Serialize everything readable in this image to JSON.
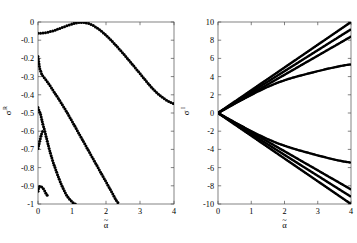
{
  "figure": {
    "background": "#ffffff",
    "line_color": "#000000",
    "panel_count": 2
  },
  "chart_data": [
    {
      "type": "scatter",
      "title": "",
      "subtitle": "",
      "xlabel": "α̃",
      "ylabel": "σ^R",
      "xlabel_base": "α",
      "ylabel_base": "σ",
      "ylabel_sup": "R",
      "xlim": [
        0,
        4
      ],
      "ylim": [
        -1,
        0
      ],
      "xticks": [
        0,
        1,
        2,
        3,
        4
      ],
      "xticklabels": [
        "0",
        "1",
        "2",
        "3",
        "4"
      ],
      "yticks": [
        0,
        -0.1,
        -0.2,
        -0.3,
        -0.4,
        -0.5,
        -0.6,
        -0.7,
        -0.8,
        -0.9,
        -1
      ],
      "yticklabels": [
        "0",
        "-0.1",
        "-0.2",
        "-0.3",
        "-0.4",
        "-0.5",
        "-0.6",
        "-0.7",
        "-0.8",
        "-0.9",
        "-1"
      ],
      "grid": false,
      "legend": null,
      "marker": "dot",
      "marker_size": 1.5,
      "series": [
        {
          "name": "branch-1",
          "comment": "uppermost branch: starts near -0.06, peaks at ~0 near alpha=1.25, decays to -0.45 at alpha=4",
          "x": [
            0.0,
            0.1,
            0.2,
            0.3,
            0.4,
            0.5,
            0.6,
            0.7,
            0.8,
            0.9,
            1.0,
            1.1,
            1.2,
            1.3,
            1.4,
            1.5,
            1.6,
            1.7,
            1.8,
            1.9,
            2.0,
            2.1,
            2.2,
            2.3,
            2.4,
            2.5,
            2.6,
            2.7,
            2.8,
            2.9,
            3.0,
            3.1,
            3.2,
            3.3,
            3.4,
            3.5,
            3.6,
            3.7,
            3.8,
            3.9,
            4.0
          ],
          "y": [
            -0.062,
            -0.061,
            -0.059,
            -0.056,
            -0.051,
            -0.045,
            -0.038,
            -0.031,
            -0.024,
            -0.017,
            -0.011,
            -0.006,
            -0.003,
            -0.002,
            -0.004,
            -0.009,
            -0.017,
            -0.028,
            -0.041,
            -0.056,
            -0.073,
            -0.091,
            -0.11,
            -0.13,
            -0.151,
            -0.172,
            -0.194,
            -0.216,
            -0.238,
            -0.261,
            -0.283,
            -0.306,
            -0.329,
            -0.351,
            -0.372,
            -0.39,
            -0.406,
            -0.42,
            -0.432,
            -0.442,
            -0.45
          ]
        },
        {
          "name": "branch-2",
          "comment": "second branch: from about -0.19 at alpha=0 descending roughly linearly, exits bottom near alpha=2.4",
          "x": [
            0.0,
            0.05,
            0.12,
            0.2,
            0.28,
            0.36,
            0.44,
            0.52,
            0.6,
            0.7,
            0.8,
            0.9,
            1.0,
            1.1,
            1.2,
            1.3,
            1.4,
            1.5,
            1.6,
            1.7,
            1.8,
            1.9,
            2.0,
            2.1,
            2.2,
            2.3,
            2.38
          ],
          "y": [
            -0.19,
            -0.255,
            -0.292,
            -0.31,
            -0.33,
            -0.352,
            -0.375,
            -0.398,
            -0.42,
            -0.45,
            -0.48,
            -0.512,
            -0.545,
            -0.578,
            -0.612,
            -0.645,
            -0.678,
            -0.712,
            -0.745,
            -0.778,
            -0.812,
            -0.845,
            -0.878,
            -0.912,
            -0.945,
            -0.98,
            -1.0
          ]
        },
        {
          "name": "branch-3",
          "comment": "third branch: from about -0.47 at alpha=0 descending steeply, exits bottom near alpha=1.1",
          "x": [
            0.0,
            0.04,
            0.08,
            0.14,
            0.2,
            0.26,
            0.32,
            0.38,
            0.44,
            0.5,
            0.56,
            0.62,
            0.68,
            0.74,
            0.8,
            0.86,
            0.92,
            0.98,
            1.04,
            1.1
          ],
          "y": [
            -0.47,
            -0.49,
            -0.51,
            -0.56,
            -0.6,
            -0.645,
            -0.69,
            -0.73,
            -0.768,
            -0.8,
            -0.832,
            -0.862,
            -0.89,
            -0.915,
            -0.938,
            -0.958,
            -0.972,
            -0.984,
            -0.994,
            -1.0
          ]
        },
        {
          "name": "branch-4",
          "comment": "fourth branch: short cluster near alpha=0 between -0.60 and -0.72",
          "x": [
            0.0,
            0.02,
            0.05,
            0.08,
            0.1,
            0.12,
            0.14
          ],
          "y": [
            -0.695,
            -0.68,
            -0.655,
            -0.632,
            -0.618,
            -0.606,
            -0.6
          ]
        },
        {
          "name": "branch-5",
          "comment": "fifth branch: cluster at the very bottom left near -0.90 to -0.95",
          "x": [
            0.0,
            0.02,
            0.04,
            0.07,
            0.1,
            0.14,
            0.18,
            0.23,
            0.28
          ],
          "y": [
            -0.93,
            -0.912,
            -0.905,
            -0.902,
            -0.905,
            -0.912,
            -0.922,
            -0.94,
            -0.955
          ]
        }
      ]
    },
    {
      "type": "line",
      "title": "",
      "subtitle": "",
      "xlabel": "α̃",
      "ylabel": "σ^I",
      "xlabel_base": "α",
      "ylabel_base": "σ",
      "ylabel_sup": "I",
      "xlim": [
        0,
        4
      ],
      "ylim": [
        -10,
        10
      ],
      "xticks": [
        0,
        1,
        2,
        3,
        4
      ],
      "xticklabels": [
        "0",
        "1",
        "2",
        "3",
        "4"
      ],
      "yticks": [
        10,
        8,
        6,
        4,
        2,
        0,
        -2,
        -4,
        -6,
        -8,
        -10
      ],
      "yticklabels": [
        "10",
        "8",
        "6",
        "4",
        "2",
        "0",
        "-2",
        "-4",
        "-6",
        "-8",
        "-10"
      ],
      "grid": false,
      "legend": null,
      "marker": "dot",
      "marker_size": 1.2,
      "series": [
        {
          "name": "upper-1",
          "comment": "steepest positive branch, reaches 10.0 at alpha=4",
          "x": [
            0.0,
            0.4,
            0.8,
            1.2,
            1.6,
            2.0,
            2.4,
            2.8,
            3.2,
            3.6,
            4.0
          ],
          "y": [
            0.0,
            1.0,
            2.0,
            3.0,
            4.0,
            5.0,
            6.0,
            7.0,
            8.0,
            9.0,
            10.0
          ]
        },
        {
          "name": "upper-2",
          "comment": "second positive branch, reaches 9.2 at alpha=4",
          "x": [
            0.0,
            0.4,
            0.8,
            1.2,
            1.6,
            2.0,
            2.4,
            2.8,
            3.2,
            3.6,
            4.0
          ],
          "y": [
            0.0,
            0.92,
            1.84,
            2.76,
            3.68,
            4.6,
            5.52,
            6.44,
            7.36,
            8.28,
            9.2
          ]
        },
        {
          "name": "upper-3",
          "comment": "third positive branch, reaches 8.4 at alpha=4",
          "x": [
            0.0,
            0.4,
            0.8,
            1.2,
            1.6,
            2.0,
            2.4,
            2.8,
            3.2,
            3.6,
            4.0
          ],
          "y": [
            0.0,
            0.84,
            1.68,
            2.52,
            3.36,
            4.2,
            5.04,
            5.88,
            6.72,
            7.56,
            8.4
          ]
        },
        {
          "name": "upper-4",
          "comment": "flattening positive branch, bends over and reaches 5.35 at alpha=4",
          "x": [
            0.0,
            0.3,
            0.6,
            0.9,
            1.2,
            1.5,
            1.8,
            2.1,
            2.4,
            2.7,
            3.0,
            3.3,
            3.6,
            3.8,
            4.0
          ],
          "y": [
            0.0,
            0.62,
            1.22,
            1.8,
            2.36,
            2.88,
            3.34,
            3.72,
            4.04,
            4.32,
            4.6,
            4.86,
            5.1,
            5.24,
            5.35
          ]
        },
        {
          "name": "lower-1",
          "comment": "steepest negative branch, reaches -10.0 at alpha=4",
          "x": [
            0.0,
            0.4,
            0.8,
            1.2,
            1.6,
            2.0,
            2.4,
            2.8,
            3.2,
            3.6,
            4.0
          ],
          "y": [
            0.0,
            -1.0,
            -2.0,
            -3.0,
            -4.0,
            -5.0,
            -6.0,
            -7.0,
            -8.0,
            -9.0,
            -10.0
          ]
        },
        {
          "name": "lower-2",
          "comment": "second negative branch, reaches -9.2 at alpha=4",
          "x": [
            0.0,
            0.4,
            0.8,
            1.2,
            1.6,
            2.0,
            2.4,
            2.8,
            3.2,
            3.6,
            4.0
          ],
          "y": [
            0.0,
            -0.92,
            -1.84,
            -2.76,
            -3.68,
            -4.6,
            -5.52,
            -6.44,
            -7.36,
            -8.28,
            -9.2
          ]
        },
        {
          "name": "lower-3",
          "comment": "third negative branch, reaches -8.4 at alpha=4",
          "x": [
            0.0,
            0.4,
            0.8,
            1.2,
            1.6,
            2.0,
            2.4,
            2.8,
            3.2,
            3.6,
            4.0
          ],
          "y": [
            0.0,
            -0.84,
            -1.68,
            -2.52,
            -3.36,
            -4.2,
            -5.04,
            -5.88,
            -6.72,
            -7.56,
            -8.4
          ]
        },
        {
          "name": "lower-4",
          "comment": "flattening negative branch, bends over and reaches -5.45 at alpha=4",
          "x": [
            0.0,
            0.3,
            0.6,
            0.9,
            1.2,
            1.5,
            1.8,
            2.1,
            2.4,
            2.7,
            3.0,
            3.3,
            3.6,
            3.8,
            4.0
          ],
          "y": [
            0.0,
            -0.62,
            -1.22,
            -1.8,
            -2.36,
            -2.88,
            -3.34,
            -3.72,
            -4.06,
            -4.36,
            -4.66,
            -4.94,
            -5.2,
            -5.34,
            -5.45
          ]
        }
      ]
    }
  ]
}
